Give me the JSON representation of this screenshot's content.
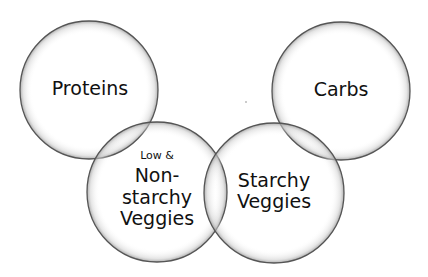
{
  "diagram": {
    "type": "venn",
    "circles": [
      {
        "id": "proteins",
        "label": "Proteins",
        "cx": 89,
        "cy": 90,
        "r": 69
      },
      {
        "id": "carbs",
        "label": "Carbs",
        "cx": 341,
        "cy": 91,
        "r": 69
      },
      {
        "id": "non-starchy",
        "label_small": "Low &",
        "label_lines": [
          "Non-",
          "starchy",
          "Veggies"
        ],
        "cx": 157,
        "cy": 192,
        "r": 70
      },
      {
        "id": "starchy",
        "label_lines": [
          "Starchy",
          "Veggies"
        ],
        "cx": 274,
        "cy": 193,
        "r": 70
      }
    ],
    "colors": {
      "stroke": "#555555",
      "fill": "#ffffff",
      "shade": "#bdbdbd"
    }
  }
}
